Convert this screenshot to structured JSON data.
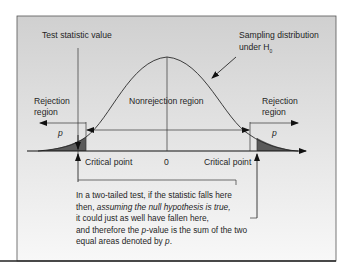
{
  "diagram": {
    "labels": {
      "test_statistic": "Test statistic value",
      "sampling_line1": "Sampling distribution",
      "sampling_line2": "under H",
      "sampling_sub": "0",
      "rejection_left_1": "Rejection",
      "rejection_left_2": "region",
      "rejection_right_1": "Rejection",
      "rejection_right_2": "region",
      "nonrejection": "Nonrejection region",
      "p_left": "p",
      "p_right": "p",
      "critical_left": "Critical point",
      "critical_right": "Critical point",
      "zero": "0"
    },
    "caption": {
      "line1": "In a two-tailed test, if the statistic falls here",
      "line2_a": "then, ",
      "line2_b": "assuming the null hypothesis is true,",
      "line3": "it could just as well have fallen here,",
      "line4_a": "and therefore the ",
      "line4_b": "p",
      "line4_c": "-value is the sum of the two",
      "line5_a": "equal areas denoted by ",
      "line5_b": "p",
      "line5_c": "."
    },
    "colors": {
      "panel_top": "#d2d2d2",
      "panel_bottom": "#f7f7f7",
      "tail_fill": "#5a5a5a",
      "line": "#222222"
    }
  }
}
